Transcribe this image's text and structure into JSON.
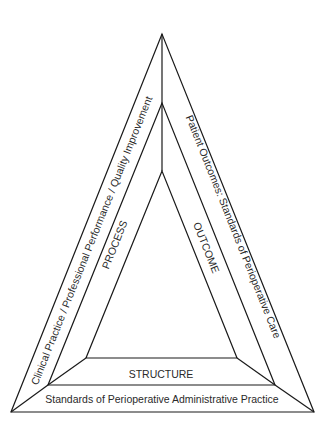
{
  "diagram": {
    "type": "nested-triangle",
    "colors": {
      "stroke": "#1a1a1a",
      "text": "#2a2a2a",
      "background": "#ffffff"
    },
    "labels": {
      "outer_left": "Clinical Practice / Professional Performance / Quality Improvement",
      "outer_right": "Patient Outcomes: Standards of Perioperative Care",
      "outer_bottom": "Standards of Perioperative Administrative Practice",
      "inner_left": "PROCESS",
      "inner_right": "OUTCOME",
      "inner_bottom": "STRUCTURE"
    }
  }
}
